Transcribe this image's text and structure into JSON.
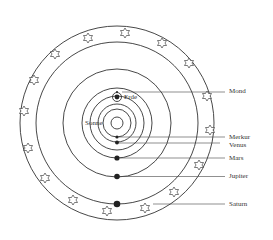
{
  "diagram": {
    "center": "Sonne",
    "labels": {
      "sun": "Sonne",
      "earth": "Erde",
      "moon": "Mond",
      "mercury": "Merkur",
      "venus": "Venus",
      "mars": "Mars",
      "jupiter": "Jupiter",
      "saturn": "Saturn"
    },
    "orbits_order": [
      "Merkur",
      "Venus",
      "Erde",
      "Mars",
      "Jupiter",
      "Saturn"
    ],
    "outer_ring": "Fixsternsphäre (stars)",
    "star_count": 17,
    "colors": {
      "line": "#333333",
      "background": "#ffffff"
    }
  }
}
